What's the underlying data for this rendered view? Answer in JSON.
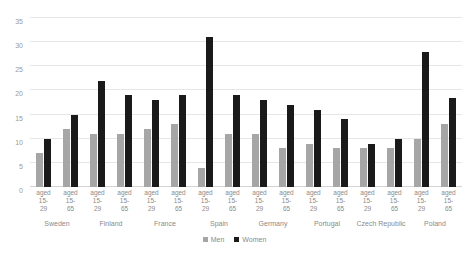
{
  "chart_data": {
    "type": "bar",
    "title": "",
    "subtitle": "",
    "xlabel": "",
    "ylabel": "",
    "ylim": [
      0,
      35
    ],
    "yticks": [
      0,
      5,
      10,
      15,
      20,
      25,
      30,
      35
    ],
    "grid": true,
    "legend_position": "bottom",
    "categories": [
      "Sweden",
      "Finland",
      "France",
      "Spain",
      "Germany",
      "Portugal",
      "Czech Republic",
      "Poland"
    ],
    "subcategories": [
      "aged 15-29",
      "aged 15-65"
    ],
    "subcategory_label_lines": [
      [
        "aged",
        "15-",
        "29"
      ],
      [
        "aged",
        "15-",
        "65"
      ]
    ],
    "series": [
      {
        "name": "Men",
        "color": "#a6a6a6",
        "values": [
          [
            7,
            12
          ],
          [
            11,
            11
          ],
          [
            12,
            13
          ],
          [
            4,
            11
          ],
          [
            11,
            8
          ],
          [
            9,
            8
          ],
          [
            8,
            8
          ],
          [
            10,
            13
          ]
        ]
      },
      {
        "name": "Women",
        "color": "#1a1a1a",
        "values": [
          [
            10,
            15
          ],
          [
            22,
            19
          ],
          [
            18,
            19
          ],
          [
            31,
            19
          ],
          [
            18,
            17
          ],
          [
            16,
            14
          ],
          [
            9,
            10
          ],
          [
            28,
            18.5
          ]
        ]
      }
    ],
    "legend": [
      {
        "label": "Men",
        "color": "#a6a6a6"
      },
      {
        "label": "Women",
        "color": "#1a1a1a"
      }
    ]
  }
}
